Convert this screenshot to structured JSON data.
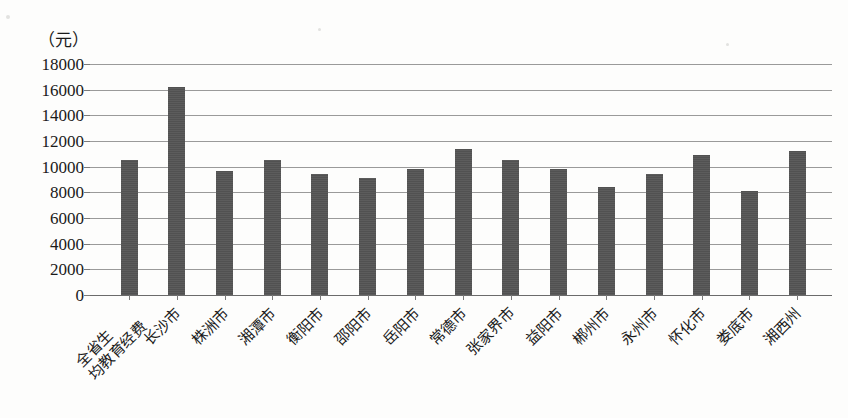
{
  "chart_data": {
    "type": "bar",
    "title": "",
    "subtitle": "",
    "xlabel": "",
    "ylabel": "（元）",
    "ylim": [
      0,
      18000
    ],
    "ytick_step": 2000,
    "yticks": [
      "18000",
      "16000",
      "14000",
      "12000",
      "10000",
      "8000",
      "6000",
      "4000",
      "2000",
      "0"
    ],
    "grid": true,
    "legend": "none",
    "bar_color": "#555555",
    "gridline_color": "#9a9a9a",
    "categories": [
      "全省生均教育经费",
      "长沙市",
      "株洲市",
      "湘潭市",
      "衡阳市",
      "邵阳市",
      "岳阳市",
      "常德市",
      "张家界市",
      "益阳市",
      "郴州市",
      "永州市",
      "怀化市",
      "娄底市",
      "湘西州"
    ],
    "category_lines": [
      [
        "全省生",
        "均教育经费"
      ],
      [
        "长沙市"
      ],
      [
        "株洲市"
      ],
      [
        "湘潭市"
      ],
      [
        "衡阳市"
      ],
      [
        "邵阳市"
      ],
      [
        "岳阳市"
      ],
      [
        "常德市"
      ],
      [
        "张家界市"
      ],
      [
        "益阳市"
      ],
      [
        "郴州市"
      ],
      [
        "永州市"
      ],
      [
        "怀化市"
      ],
      [
        "娄底市"
      ],
      [
        "湘西州"
      ]
    ],
    "values": [
      10550,
      16200,
      9700,
      10550,
      9400,
      9100,
      9800,
      11350,
      10550,
      9800,
      8400,
      9450,
      10900,
      8100,
      11200
    ]
  }
}
